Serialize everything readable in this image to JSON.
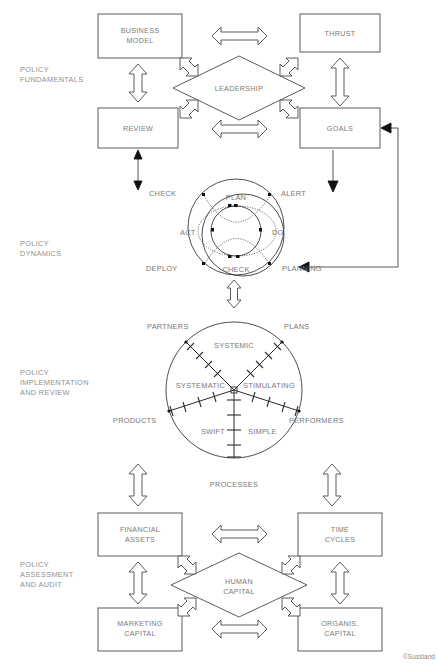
{
  "copyright": "©Sussland",
  "sections": [
    {
      "id": "fundamentals",
      "label": "POLICY\nFUNDAMENTALS",
      "lines": [
        "POLICY",
        "FUNDAMENTALS"
      ]
    },
    {
      "id": "dynamics",
      "label": "POLICY\nDYNAMICS",
      "lines": [
        "POLICY",
        "DYNAMICS"
      ]
    },
    {
      "id": "implementation",
      "label": "POLICY IMPLEMENTATION AND REVIEW",
      "lines": [
        "POLICY",
        "IMPLEMENTATION",
        "AND REVIEW"
      ]
    },
    {
      "id": "assessment",
      "label": "POLICY ASSESSMENT AND AUDIT",
      "lines": [
        "POLICY",
        "ASSESSMENT",
        "AND AUDIT"
      ]
    }
  ],
  "fundamentals": {
    "boxes": [
      {
        "id": "business-model",
        "lines": [
          "BUSINESS",
          "MODEL"
        ]
      },
      {
        "id": "thrust",
        "lines": [
          "THRUST"
        ]
      },
      {
        "id": "review",
        "lines": [
          "REVIEW"
        ]
      },
      {
        "id": "goals",
        "lines": [
          "GOALS"
        ]
      }
    ],
    "diamond": {
      "id": "leadership",
      "lines": [
        "LEADERSHIP"
      ]
    }
  },
  "dynamics": {
    "outer_labels": [
      "CHECK",
      "ALERT",
      "DEPLOY",
      "PLANNING"
    ],
    "inner_labels": [
      "PLAN",
      "DO",
      "CHECK",
      "ACT"
    ],
    "outer": {
      "top_left": "CHECK",
      "top_right": "ALERT",
      "bottom_left": "DEPLOY",
      "bottom_right": "PLANNING"
    },
    "inner": {
      "top": "PLAN",
      "right": "DO",
      "bottom": "CHECK",
      "left": "ACT"
    }
  },
  "implementation": {
    "axes": [
      {
        "id": "partners",
        "outer": "PARTNERS",
        "inner": "SYSTEMIC"
      },
      {
        "id": "plans",
        "outer": "PLANS",
        "inner": "STIMULATING"
      },
      {
        "id": "products",
        "outer": "PRODUCTS",
        "inner": "SYSTEMATIC"
      },
      {
        "id": "performers",
        "outer": "PERFORMERS",
        "inner": "SIMPLE"
      },
      {
        "id": "processes",
        "outer": "PROCESSES",
        "inner": "SWIFT"
      }
    ],
    "inner_labels": [
      "SYSTEMIC",
      "SYSTEMATIC",
      "STIMULATING",
      "SWIFT",
      "SIMPLE"
    ],
    "outer_labels": [
      "PARTNERS",
      "PLANS",
      "PRODUCTS",
      "PERFORMERS",
      "PROCESSES"
    ]
  },
  "assessment": {
    "boxes": [
      {
        "id": "financial-assets",
        "lines": [
          "FINANCIAL",
          "ASSETS"
        ]
      },
      {
        "id": "time-cycles",
        "lines": [
          "TIME",
          "CYCLES"
        ]
      },
      {
        "id": "marketing-capital",
        "lines": [
          "MARKETING",
          "CAPITAL"
        ]
      },
      {
        "id": "organis-capital",
        "lines": [
          "ORGANIS.",
          "CAPITAL"
        ]
      }
    ],
    "diamond": {
      "id": "human-capital",
      "lines": [
        "HUMAN",
        "CAPITAL"
      ]
    }
  },
  "colors": {
    "line": "#3a3a3a",
    "text": "#777777",
    "side_text": "#909090",
    "background": "#ffffff"
  }
}
